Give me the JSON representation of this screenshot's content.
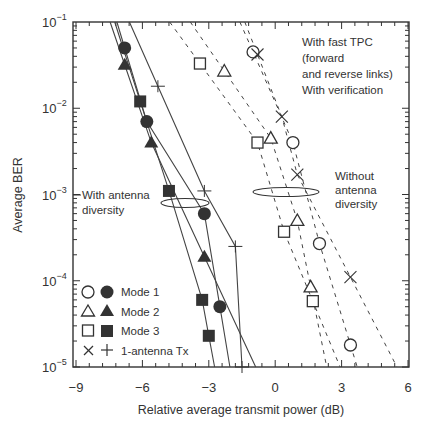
{
  "chart_data": {
    "type": "scatter",
    "title": "",
    "xlabel": "Relative average transmit power (dB)",
    "ylabel": "Average BER",
    "xlim": [
      -9,
      6
    ],
    "ylim": [
      1e-05,
      0.1
    ],
    "yscale": "log",
    "x_ticks": [
      "-9",
      "-6",
      "-3",
      "0",
      "3",
      "6"
    ],
    "y_ticks": [
      "10^-1",
      "10^-2",
      "10^-3",
      "10^-4",
      "10^-5"
    ],
    "grid": false,
    "legend": {
      "position": "lower-left",
      "entries": [
        {
          "label": "Mode 1",
          "markers": [
            "open-circle",
            "filled-circle"
          ]
        },
        {
          "label": "Mode 2",
          "markers": [
            "open-triangle",
            "filled-triangle"
          ]
        },
        {
          "label": "Mode 3",
          "markers": [
            "open-square",
            "filled-square"
          ]
        },
        {
          "label": "1-antenna Tx",
          "markers": [
            "x",
            "plus"
          ]
        }
      ]
    },
    "annotations": [
      {
        "text": [
          "With fast TPC",
          "(forward",
          "and reverse links)",
          "With verification"
        ]
      },
      {
        "text": [
          "With antenna",
          "diversity"
        ]
      },
      {
        "text": [
          "Without",
          "antenna",
          "diversity"
        ]
      }
    ],
    "series": [
      {
        "name": "Mode 1 (with antenna diversity)",
        "marker": "filled-circle",
        "line": "solid",
        "points": [
          [
            -6.8,
            0.05
          ],
          [
            -5.8,
            0.007
          ],
          [
            -3.2,
            0.0006
          ],
          [
            -2.5,
            5e-05
          ]
        ]
      },
      {
        "name": "Mode 2 (with antenna diversity)",
        "marker": "filled-triangle",
        "line": "solid",
        "points": [
          [
            -6.8,
            0.032
          ],
          [
            -5.6,
            0.004
          ],
          [
            -3.2,
            0.00019
          ]
        ]
      },
      {
        "name": "Mode 3 (with antenna diversity)",
        "marker": "filled-square",
        "line": "solid",
        "points": [
          [
            -6.1,
            0.012
          ],
          [
            -4.8,
            0.0011
          ],
          [
            -3.3,
            6e-05
          ],
          [
            -3.0,
            2.3e-05
          ]
        ]
      },
      {
        "name": "1-antenna Tx (with antenna diversity)",
        "marker": "plus",
        "line": "solid",
        "points": [
          [
            -5.3,
            0.018
          ],
          [
            -3.2,
            0.0011
          ],
          [
            -1.8,
            0.00025
          ],
          [
            -1.5,
            1e-05
          ]
        ]
      },
      {
        "name": "Mode 1 (without antenna diversity)",
        "marker": "open-circle",
        "line": "dashed",
        "points": [
          [
            -1.0,
            0.045
          ],
          [
            0.8,
            0.004
          ],
          [
            2.0,
            0.00027
          ],
          [
            3.4,
            1.8e-05
          ]
        ]
      },
      {
        "name": "Mode 2 (without antenna diversity)",
        "marker": "open-triangle",
        "line": "dashed",
        "points": [
          [
            -2.3,
            0.027
          ],
          [
            -0.2,
            0.0045
          ],
          [
            1.0,
            0.0005
          ],
          [
            1.6,
            8.5e-05
          ]
        ]
      },
      {
        "name": "Mode 3 (without antenna diversity)",
        "marker": "open-square",
        "line": "dashed",
        "points": [
          [
            -3.4,
            0.033
          ],
          [
            -0.8,
            0.004
          ],
          [
            0.4,
            0.00037
          ],
          [
            1.7,
            5.8e-05
          ]
        ]
      },
      {
        "name": "1-antenna Tx (without antenna diversity)",
        "marker": "x",
        "line": "dashed",
        "points": [
          [
            -0.8,
            0.042
          ],
          [
            0.3,
            0.008
          ],
          [
            1.0,
            0.0017
          ],
          [
            3.4,
            0.00011
          ]
        ]
      }
    ]
  }
}
